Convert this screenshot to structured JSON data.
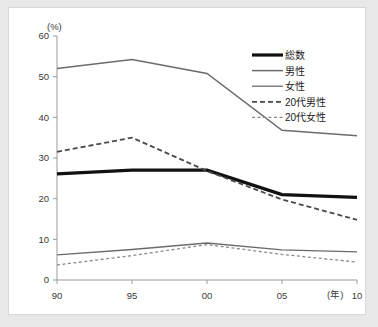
{
  "chart_data": {
    "type": "line",
    "title": "",
    "xlabel": "(年)",
    "ylabel": "(%)",
    "x": [
      "90",
      "95",
      "00",
      "05",
      "10"
    ],
    "categories": [
      "90",
      "95",
      "00",
      "05",
      "10"
    ],
    "xlim": [
      0,
      4
    ],
    "ylim": [
      0,
      60
    ],
    "y_ticks": [
      "0",
      "10",
      "20",
      "30",
      "40",
      "50",
      "60"
    ],
    "grid": false,
    "legend_position": "top-right",
    "series": [
      {
        "name": "総数",
        "values": [
          26.1,
          27.0,
          27.0,
          21.0,
          20.3
        ],
        "color": "#111111",
        "width": 3.2,
        "dash": "none"
      },
      {
        "name": "男性",
        "values": [
          52.0,
          54.2,
          50.8,
          36.8,
          35.5
        ],
        "color": "#6b6b6b",
        "width": 1.5,
        "dash": "none"
      },
      {
        "name": "女性",
        "values": [
          6.2,
          7.5,
          9.1,
          7.4,
          6.9
        ],
        "color": "#6b6b6b",
        "width": 1.3,
        "dash": "none"
      },
      {
        "name": "20代男性",
        "values": [
          31.5,
          35.0,
          26.8,
          19.8,
          14.8
        ],
        "color": "#4a4a4a",
        "width": 1.8,
        "dash": "5,3"
      },
      {
        "name": "20代女性",
        "values": [
          3.7,
          6.0,
          8.7,
          6.3,
          4.4
        ],
        "color": "#8a8a8a",
        "width": 1.3,
        "dash": "3,2.5"
      }
    ]
  },
  "axes": {
    "y_unit_label": "(%)",
    "x_unit_label": "(年)"
  },
  "legend": {
    "items": [
      {
        "label": "総数"
      },
      {
        "label": "男性"
      },
      {
        "label": "女性"
      },
      {
        "label": "20代男性"
      },
      {
        "label": "20代女性"
      }
    ]
  }
}
